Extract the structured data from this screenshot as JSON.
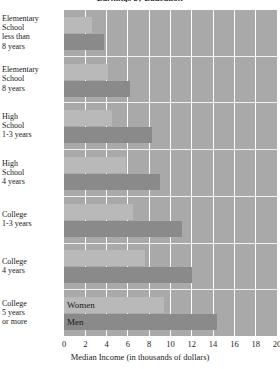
{
  "chart_data": {
    "type": "bar",
    "orientation": "horizontal",
    "title": "Earnings by Education",
    "xlabel": "Median Income (in thousands of dollars)",
    "ylabel": "",
    "xlim": [
      0,
      20
    ],
    "xticks": [
      0,
      2,
      4,
      6,
      8,
      10,
      12,
      14,
      16,
      18,
      20
    ],
    "xtick_labels": [
      "0",
      "2",
      "4",
      "6",
      "8",
      "10",
      "12",
      "14",
      "16",
      "18",
      "20"
    ],
    "grid": "vertical",
    "legend_position": "inside-last-group",
    "categories": [
      "Elementary School less than 8 years",
      "Elementary School 8 years",
      "High School 1-3 years",
      "High School 4 years",
      "College 1-3 years",
      "College 4 years",
      "College 5 years or more"
    ],
    "category_label_lines": [
      [
        "Elementary",
        "School",
        "less than",
        "8 years"
      ],
      [
        "Elementary",
        "School",
        "8 years"
      ],
      [
        "High",
        "School",
        "1-3 years"
      ],
      [
        "High",
        "School",
        "4 years"
      ],
      [
        "College",
        "1-3 years"
      ],
      [
        "College",
        "4 years"
      ],
      [
        "College",
        "5 years",
        "or more"
      ]
    ],
    "series": [
      {
        "name": "Women",
        "color": "#b9b9b9",
        "values": [
          2.6,
          4.1,
          4.5,
          5.8,
          6.5,
          7.6,
          9.4
        ]
      },
      {
        "name": "Men",
        "color": "#8a8a8a",
        "values": [
          3.8,
          6.2,
          8.3,
          9.0,
          11.1,
          12.0,
          14.4
        ]
      }
    ]
  },
  "legend": {
    "women_label": "Women",
    "men_label": "Men"
  },
  "colors": {
    "plot_background": "#a9a9a9",
    "gridline": "#ffffff",
    "women_bar": "#b9b9b9",
    "men_bar": "#8a8a8a",
    "text": "#1a1a1a",
    "page_background": "#ffffff"
  }
}
